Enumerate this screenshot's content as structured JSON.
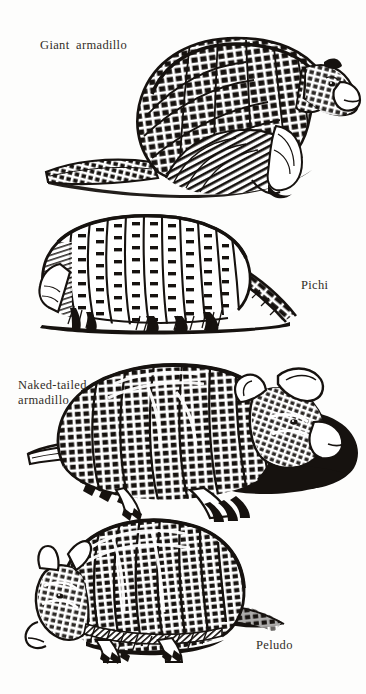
{
  "page": {
    "background_color": "#fdfdfc",
    "ink_color": "#16120f",
    "text_color": "#322d28",
    "kind": "book-plate-illustration"
  },
  "figures": [
    {
      "id": "giant-armadillo",
      "label": "Giant  armadillo",
      "label_x": 40,
      "label_y": 38,
      "species_order": 1
    },
    {
      "id": "pichi",
      "label": "Pichi",
      "label_x": 301,
      "label_y": 278,
      "species_order": 2
    },
    {
      "id": "naked-tailed-armadillo",
      "label": "Naked-tailed\narmadillo",
      "label_x": 18,
      "label_y": 378,
      "species_order": 3
    },
    {
      "id": "peludo",
      "label": "Peludo",
      "label_x": 256,
      "label_y": 638,
      "species_order": 4
    }
  ]
}
